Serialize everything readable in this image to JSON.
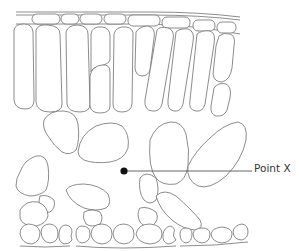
{
  "diagram": {
    "layers": [
      "cuticle",
      "upper epidermis",
      "palisade mesophyll",
      "spongy mesophyll",
      "lower epidermis"
    ],
    "annotation": {
      "label": "Point X",
      "marker_x": 124,
      "marker_y": 171,
      "line_end_x": 252
    },
    "colors": {
      "outline": "#6f6f6f",
      "marker": "#111111",
      "label_text": "#333333",
      "background": "#ffffff"
    }
  }
}
